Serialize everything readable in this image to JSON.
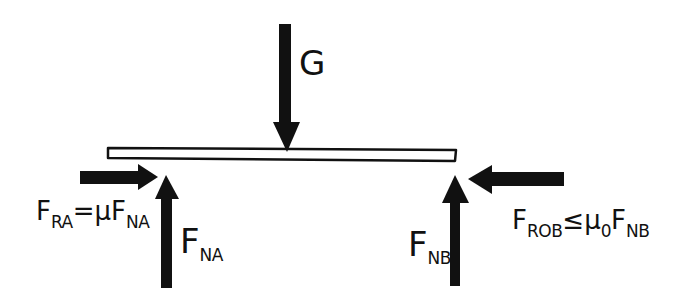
{
  "diagram": {
    "colors": {
      "ink": "#111111",
      "background": "#ffffff"
    },
    "beam": {
      "label": "beam"
    },
    "forces": [
      {
        "id": "G",
        "direction": "down",
        "label_main": "G",
        "label_sub": ""
      },
      {
        "id": "FRA",
        "direction": "right",
        "label_main": "F",
        "label_sub": "RA",
        "relation": "=",
        "coef": "μ",
        "coef_sub": "",
        "rhs_main": "F",
        "rhs_sub": "NA"
      },
      {
        "id": "FNA",
        "direction": "up",
        "label_main": "F",
        "label_sub": "NA"
      },
      {
        "id": "FNB",
        "direction": "up",
        "label_main": "F",
        "label_sub": "NB"
      },
      {
        "id": "FROB",
        "direction": "left",
        "label_main": "F",
        "label_sub": "ROB",
        "relation": "≤",
        "coef": "μ",
        "coef_sub": "0",
        "rhs_main": "F",
        "rhs_sub": "NB"
      }
    ]
  }
}
